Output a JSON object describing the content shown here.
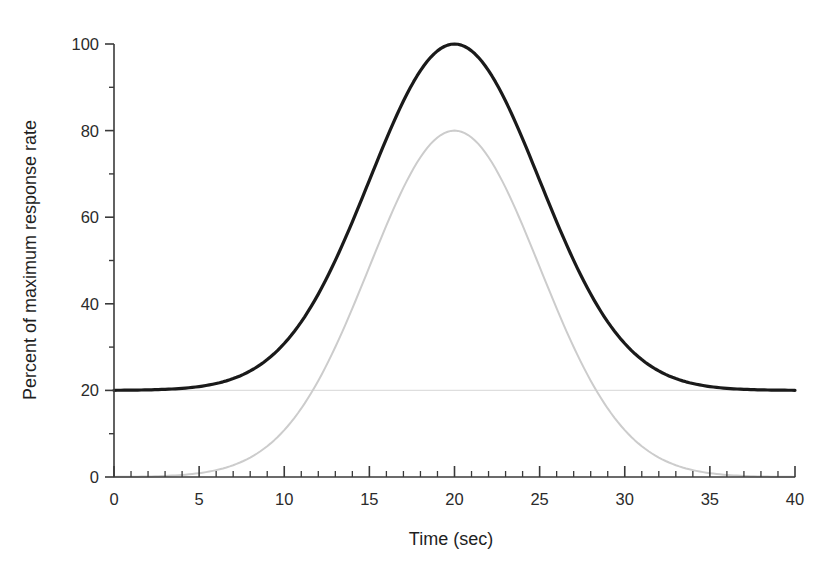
{
  "chart_data": {
    "type": "line",
    "title": "",
    "xlabel": "Time (sec)",
    "ylabel": "Percent of maximum response rate",
    "xlim": [
      0,
      40
    ],
    "ylim": [
      0,
      100
    ],
    "xticks": [
      0,
      5,
      10,
      15,
      20,
      25,
      30,
      35,
      40
    ],
    "xtick_labels": [
      "0",
      "5",
      "10",
      "15",
      "20",
      "25",
      "30",
      "35",
      "40"
    ],
    "x_minor_tick_interval": 1,
    "yticks": [
      0,
      20,
      40,
      60,
      80,
      100
    ],
    "ytick_labels": [
      "0",
      "20",
      "40",
      "60",
      "80",
      "100"
    ],
    "y_minor_ticks": [
      10,
      30,
      50,
      70,
      90
    ],
    "grid": false,
    "legend": "none",
    "series": [
      {
        "name": "total-response",
        "color": "#1a1a1a",
        "line_width": 3.2,
        "peak_x": 20,
        "peak_y": 100,
        "baseline": 20,
        "sigma": 5.0,
        "x": [
          0,
          1,
          2,
          3,
          4,
          5,
          6,
          7,
          8,
          9,
          10,
          11,
          12,
          13,
          14,
          15,
          16,
          17,
          18,
          19,
          20,
          21,
          22,
          23,
          24,
          25,
          26,
          27,
          28,
          29,
          30,
          31,
          32,
          33,
          34,
          35,
          36,
          37,
          38,
          39,
          40
        ],
        "y": [
          20.1,
          20.2,
          20.3,
          20.6,
          21.1,
          21.8,
          23.0,
          24.7,
          27.1,
          30.4,
          34.8,
          40.2,
          46.6,
          53.7,
          61.1,
          68.2,
          74.7,
          80.3,
          84.8,
          88.0,
          90.0,
          88.0,
          84.8,
          80.3,
          74.7,
          68.2,
          61.1,
          53.7,
          46.6,
          40.2,
          34.8,
          30.4,
          27.1,
          24.7,
          23.0,
          21.8,
          21.1,
          20.6,
          20.3,
          20.2,
          20.1
        ]
      },
      {
        "name": "component-response",
        "color": "#cccccc",
        "line_width": 2.0,
        "peak_x": 20,
        "peak_y": 80,
        "baseline": 0,
        "sigma": 5.0,
        "x": [
          0,
          1,
          2,
          3,
          4,
          5,
          6,
          7,
          8,
          9,
          10,
          11,
          12,
          13,
          14,
          15,
          16,
          17,
          18,
          19,
          20,
          21,
          22,
          23,
          24,
          25,
          26,
          27,
          28,
          29,
          30,
          31,
          32,
          33,
          34,
          35,
          36,
          37,
          38,
          39,
          40
        ],
        "y": [
          0.1,
          0.2,
          0.3,
          0.6,
          1.1,
          1.8,
          3.0,
          4.7,
          7.1,
          10.4,
          14.8,
          20.2,
          26.6,
          33.7,
          41.1,
          48.2,
          54.7,
          60.3,
          64.8,
          68.0,
          70.0,
          68.0,
          64.8,
          60.3,
          54.7,
          48.2,
          41.1,
          33.7,
          26.6,
          20.2,
          14.8,
          10.4,
          7.1,
          4.7,
          3.0,
          1.8,
          1.1,
          0.6,
          0.3,
          0.2,
          0.1
        ]
      }
    ],
    "reference_lines": [
      {
        "name": "baseline-20",
        "orientation": "horizontal",
        "value": 20,
        "color": "#dedede"
      }
    ]
  },
  "axis": {
    "x_title": "Time (sec)",
    "y_title": "Percent of maximum response rate"
  },
  "colors": {
    "dark_curve": "#1a1a1a",
    "light_curve": "#cccccc",
    "axis": "#3a3a3a",
    "background": "#ffffff"
  }
}
